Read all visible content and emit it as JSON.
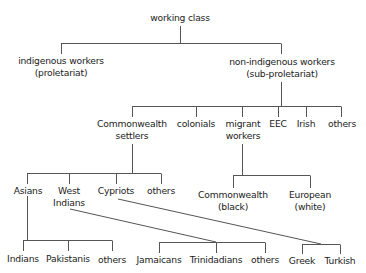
{
  "diagram": {
    "type": "tree",
    "line_color": "#555555",
    "nodes": {
      "root": {
        "line1": "working class"
      },
      "indigenous": {
        "line1": "indigenous workers",
        "line2": "(proletariat)"
      },
      "non_indigenous": {
        "line1": "non-indigenous workers",
        "line2": "(sub-proletariat)"
      },
      "commonwealth_settlers": {
        "line1": "Commonwealth",
        "line2": "settlers"
      },
      "colonials": {
        "line1": "colonials"
      },
      "migrant_workers": {
        "line1": "migrant",
        "line2": "workers"
      },
      "eec": {
        "line1": "EEC"
      },
      "irish": {
        "line1": "Irish"
      },
      "others_ni": {
        "line1": "others"
      },
      "asians": {
        "line1": "Asians"
      },
      "west_indians": {
        "line1": "West",
        "line2": "Indians"
      },
      "cypriots": {
        "line1": "Cypriots"
      },
      "others_cs": {
        "line1": "others"
      },
      "commonwealth_black": {
        "line1": "Commonwealth",
        "line2": "(black)"
      },
      "european_white": {
        "line1": "European",
        "line2": "(white)"
      },
      "indians": {
        "line1": "Indians"
      },
      "pakistanis": {
        "line1": "Pakistanis"
      },
      "others_asians": {
        "line1": "others"
      },
      "jamaicans": {
        "line1": "Jamaicans"
      },
      "trinidadians": {
        "line1": "Trinidadians"
      },
      "others_wi": {
        "line1": "others"
      },
      "greek": {
        "line1": "Greek"
      },
      "turkish": {
        "line1": "Turkish"
      }
    }
  }
}
